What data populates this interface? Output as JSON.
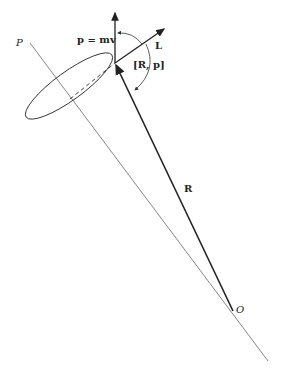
{
  "figure": {
    "labels": {
      "P": "P",
      "O": "O",
      "momentum": "p = mv",
      "L": "L",
      "commutator": "[R, p]",
      "R": "R"
    },
    "colors": {
      "line": "#222222",
      "axis": "#555555",
      "background": "#ffffff"
    }
  }
}
